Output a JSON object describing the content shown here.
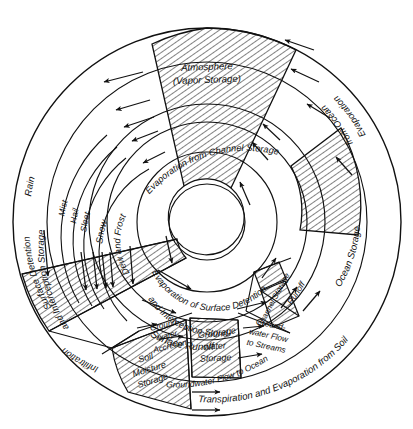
{
  "figure": {
    "center_label": "",
    "geometry": {
      "cx": 207,
      "cy": 222,
      "r_inner": 38,
      "r_ring1": 68,
      "r_ring2": 100,
      "r_ring3": 118,
      "r_ring4": 140,
      "r_outer": 196
    },
    "colors": {
      "stroke": "#111111",
      "hatch": "#111111",
      "background": "#ffffff"
    }
  },
  "labels": {
    "atmosphere": "Atmosphere",
    "atmosphere_sub": "(Vapor Storage)",
    "rain": "Rain",
    "mist": "Mist",
    "hail": "Hail",
    "sleet": "Sleet",
    "snow": "Snow",
    "dew_and_frost": "Dew and Frost",
    "surface_detention": "Surface Detention",
    "surface_detention_2": "and Interception Storage",
    "infiltration": "Infiltration",
    "groundwater_accretion_1": "Ground-",
    "groundwater_accretion_2": "water",
    "groundwater_accretion_3": "Accretion",
    "soil_moisture_1": "Soil",
    "soil_moisture_2": "Moisture",
    "soil_moisture_3": "Storage",
    "groundwater_storage_1": "Ground-",
    "groundwater_storage_2": "water",
    "groundwater_storage_3": "Storage",
    "gw_flow_streams_1": "Ground-",
    "gw_flow_streams_2": "water Flow",
    "gw_flow_streams_3": "to Streams",
    "groundwater_flow_ocean": "Groundwater Flow to Ocean",
    "surface_runoff": "Surface Runoff",
    "evap_surface_detention_1": "Evaporation of Surface Detention",
    "evap_surface_detention_2": "and Interception Storage",
    "evap_channel_storage": "Evaporation from Channel Storage",
    "channel_storage": "Channel Storage",
    "runoff": "Runoff",
    "ocean_storage": "Ocean Storage",
    "evaporation_from_ocean_1": "Evaporation",
    "evaporation_from_ocean_2": "from Ocean",
    "transpiration_soil": "Transpiration and Evaporation from Soil"
  },
  "regions": [
    {
      "name": "atmosphere",
      "label": "Atmosphere (Vapor Storage)",
      "hatched": true,
      "ring": "inner-wedge"
    },
    {
      "name": "rain",
      "label": "Rain",
      "hatched": false,
      "ring": "outer"
    },
    {
      "name": "mist",
      "label": "Mist",
      "hatched": false,
      "ring": "band"
    },
    {
      "name": "hail",
      "label": "Hail",
      "hatched": false,
      "ring": "band"
    },
    {
      "name": "sleet",
      "label": "Sleet",
      "hatched": false,
      "ring": "band"
    },
    {
      "name": "snow",
      "label": "Snow",
      "hatched": false,
      "ring": "band"
    },
    {
      "name": "dew-and-frost",
      "label": "Dew and Frost",
      "hatched": false,
      "ring": "inner"
    },
    {
      "name": "surface-detention",
      "label": "Surface Detention and Interception Storage",
      "hatched": true,
      "ring": "outer"
    },
    {
      "name": "infiltration",
      "label": "Infiltration",
      "hatched": false,
      "ring": "mid"
    },
    {
      "name": "groundwater-accretion",
      "label": "Ground-water Accretion",
      "hatched": false,
      "ring": "mid"
    },
    {
      "name": "soil-moisture-storage",
      "label": "Soil Moisture Storage",
      "hatched": true,
      "ring": "mid"
    },
    {
      "name": "groundwater-storage",
      "label": "Ground-water Storage",
      "hatched": true,
      "ring": "mid"
    },
    {
      "name": "groundwater-flow-to-streams",
      "label": "Ground-water Flow to Streams",
      "hatched": false,
      "ring": "mid"
    },
    {
      "name": "groundwater-flow-to-ocean",
      "label": "Groundwater Flow to Ocean",
      "hatched": false,
      "ring": "outer"
    },
    {
      "name": "surface-runoff",
      "label": "Surface Runoff",
      "hatched": false,
      "ring": "ring2"
    },
    {
      "name": "evaporation-surface-detention",
      "label": "Evaporation of Surface Detention and Interception Storage",
      "hatched": false,
      "ring": "ring1"
    },
    {
      "name": "evaporation-from-channel-storage",
      "label": "Evaporation from Channel Storage",
      "hatched": false,
      "ring": "ring2"
    },
    {
      "name": "channel-storage",
      "label": "Channel Storage",
      "hatched": true,
      "ring": "mid"
    },
    {
      "name": "runoff",
      "label": "Runoff",
      "hatched": false,
      "ring": "mid"
    },
    {
      "name": "ocean-storage",
      "label": "Ocean Storage",
      "hatched": true,
      "ring": "ring3"
    },
    {
      "name": "evaporation-from-ocean",
      "label": "Evaporation from Ocean",
      "hatched": false,
      "ring": "outer"
    },
    {
      "name": "transpiration-evaporation-soil",
      "label": "Transpiration and Evaporation from Soil",
      "hatched": false,
      "ring": "outer"
    }
  ]
}
